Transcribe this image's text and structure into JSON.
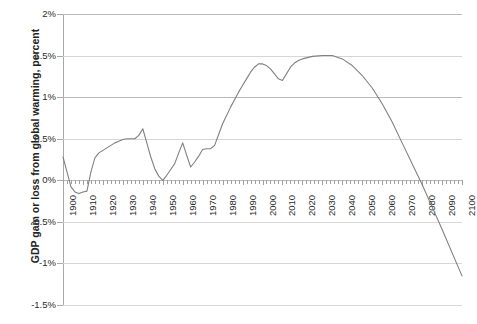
{
  "chart_data": {
    "type": "line",
    "title": "",
    "xlabel": "",
    "ylabel": "GDP gain or loss from global warming, percent",
    "xlim": [
      1900,
      2100
    ],
    "ylim": [
      -1.5,
      2.0
    ],
    "ytick_labels": [
      "2%",
      "1.5%",
      "1%",
      "0.5%",
      "0%",
      "-0.5%",
      "-1%",
      "-1.5%"
    ],
    "ytick_values": [
      2.0,
      1.5,
      1.0,
      0.5,
      0.0,
      -0.5,
      -1.0,
      -1.5
    ],
    "xtick_labels": [
      "1900",
      "1910",
      "1920",
      "1930",
      "1940",
      "1950",
      "1960",
      "1970",
      "1980",
      "1990",
      "2000",
      "2010",
      "2020",
      "2030",
      "2040",
      "2050",
      "2060",
      "2070",
      "2080",
      "2090",
      "2100"
    ],
    "xtick_values": [
      1900,
      1910,
      1920,
      1930,
      1940,
      1950,
      1960,
      1970,
      1980,
      1990,
      2000,
      2010,
      2020,
      2030,
      2040,
      2050,
      2060,
      2070,
      2080,
      2090,
      2100
    ],
    "minor_tick_step": 2,
    "grid": true,
    "legend": "none",
    "line_color": "#808080",
    "series": [
      {
        "name": "GDP gain or loss from global warming",
        "x": [
          1900,
          1902,
          1904,
          1906,
          1908,
          1910,
          1912,
          1914,
          1916,
          1918,
          1920,
          1922,
          1924,
          1926,
          1928,
          1930,
          1932,
          1934,
          1936,
          1938,
          1940,
          1942,
          1944,
          1946,
          1948,
          1950,
          1952,
          1954,
          1956,
          1958,
          1960,
          1962,
          1964,
          1966,
          1968,
          1970,
          1972,
          1974,
          1976,
          1978,
          1980,
          1982,
          1984,
          1986,
          1988,
          1990,
          1992,
          1994,
          1996,
          1998,
          2000,
          2002,
          2004,
          2006,
          2008,
          2010,
          2012,
          2014,
          2016,
          2018,
          2020,
          2025,
          2030,
          2035,
          2040,
          2045,
          2050,
          2055,
          2060,
          2065,
          2070,
          2075,
          2080,
          2085,
          2090,
          2095,
          2100
        ],
        "y": [
          0.28,
          0.1,
          -0.08,
          -0.14,
          -0.16,
          -0.14,
          -0.13,
          0.1,
          0.27,
          0.33,
          0.36,
          0.39,
          0.42,
          0.45,
          0.47,
          0.49,
          0.5,
          0.5,
          0.5,
          0.54,
          0.62,
          0.45,
          0.28,
          0.14,
          0.05,
          0.0,
          0.06,
          0.13,
          0.2,
          0.33,
          0.45,
          0.3,
          0.16,
          0.22,
          0.29,
          0.37,
          0.38,
          0.38,
          0.42,
          0.55,
          0.68,
          0.78,
          0.88,
          0.97,
          1.06,
          1.14,
          1.22,
          1.3,
          1.36,
          1.4,
          1.4,
          1.38,
          1.34,
          1.28,
          1.22,
          1.2,
          1.28,
          1.36,
          1.41,
          1.44,
          1.46,
          1.49,
          1.5,
          1.5,
          1.46,
          1.38,
          1.26,
          1.11,
          0.92,
          0.7,
          0.45,
          0.2,
          -0.05,
          -0.32,
          -0.59,
          -0.87,
          -1.15
        ]
      }
    ]
  },
  "axis": {
    "y_title": "GDP gain or loss from global warming, percent"
  }
}
